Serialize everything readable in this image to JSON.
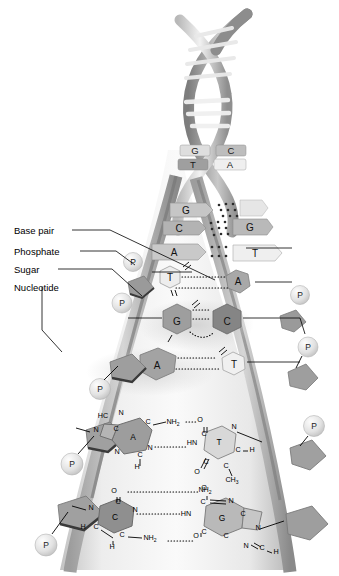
{
  "figure": {
    "labels": [
      {
        "id": "base-pair",
        "text": "Base pair"
      },
      {
        "id": "phosphate",
        "text": "Phosphate"
      },
      {
        "id": "sugar",
        "text": "Sugar"
      },
      {
        "id": "nucleotide",
        "text": "Nucleotide"
      }
    ],
    "helix": {
      "pairs": [
        {
          "left": "G",
          "right": "C"
        },
        {
          "left": "T",
          "right": "A"
        }
      ]
    },
    "ladder": {
      "rungs": [
        {
          "left": "G",
          "right": "",
          "bonds": 3
        },
        {
          "left": "C",
          "right": "G",
          "bonds": 3
        },
        {
          "left": "A",
          "right": "T",
          "bonds": 2
        }
      ]
    },
    "hex_pairs": [
      {
        "left": "T",
        "right": "A",
        "bonds": 2
      },
      {
        "left": "G",
        "right": "C",
        "bonds": 3
      },
      {
        "left": "A",
        "right": "T",
        "bonds": 2
      }
    ],
    "phosphate_symbol": "P",
    "chem": {
      "at_pair": {
        "left_base": "A",
        "right_base": "T",
        "atoms_left": [
          "HC",
          "N",
          "C",
          "C",
          "N",
          "N",
          "C",
          "H"
        ],
        "atoms_right": [
          "O",
          "C",
          "N",
          "C",
          "H",
          "C",
          "C",
          "O"
        ],
        "amine": "NH",
        "amine_sub": "2",
        "imine": "HN",
        "methyl": "CH",
        "methyl_sub": "3",
        "bonds": 2
      },
      "cg_pair": {
        "left_base": "C",
        "right_base": "G",
        "atoms_left": [
          "O",
          "C",
          "N",
          "N",
          "C",
          "C",
          "H",
          "H"
        ],
        "atoms_right": [
          "C",
          "N",
          "C",
          "C",
          "C",
          "N",
          "C",
          "H",
          "N"
        ],
        "amine": "NH",
        "amine_sub": "2",
        "imine": "HN",
        "oxygen": "O",
        "bonds": 3
      }
    },
    "colors": {
      "purine": "#8c8c8c",
      "pyrimidine": "#c9c9c9",
      "sugar": "#9a9a9a",
      "phosphate": "#dcdcdc",
      "ribbon_dark": "#888888",
      "ribbon_light": "#d0d0d0",
      "highlight": "#d8d8d8"
    }
  }
}
